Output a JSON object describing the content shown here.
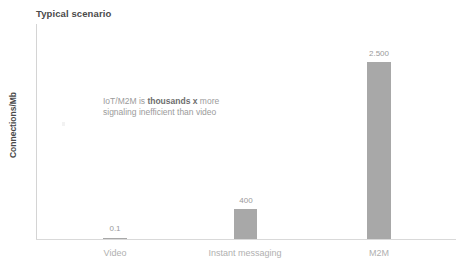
{
  "chart_data": {
    "type": "bar",
    "title": "Typical scenario",
    "xlabel": "",
    "ylabel": "Connections/Mb",
    "categories": [
      "Video",
      "Instant messaging",
      "M2M"
    ],
    "values": [
      0.1,
      400,
      2500
    ],
    "value_labels": [
      "0.1",
      "400",
      "2.500"
    ],
    "series": [
      {
        "name": "Connections/Mb",
        "values": [
          0.1,
          400,
          2500
        ]
      }
    ],
    "ylim": [
      0,
      3000
    ],
    "grid": false,
    "legend": null,
    "bar_color": "#a8a8a8",
    "annotations": [
      {
        "id": "efficiency-callout",
        "line1_prefix": "IoT/M2M is ",
        "line1_strong": "thousands x",
        "line1_suffix": " more",
        "line2": "signaling inefficient than video"
      }
    ]
  },
  "colors": {
    "bar": "#a8a8a8",
    "axis": "#d9d9d9",
    "title_text": "#4a4a4a",
    "tick_text": "#b0b0b0",
    "value_text": "#9a9a9a",
    "annotation_text": "#9b9b9b",
    "annotation_strong_text": "#6d6d6d",
    "background": "#ffffff"
  }
}
